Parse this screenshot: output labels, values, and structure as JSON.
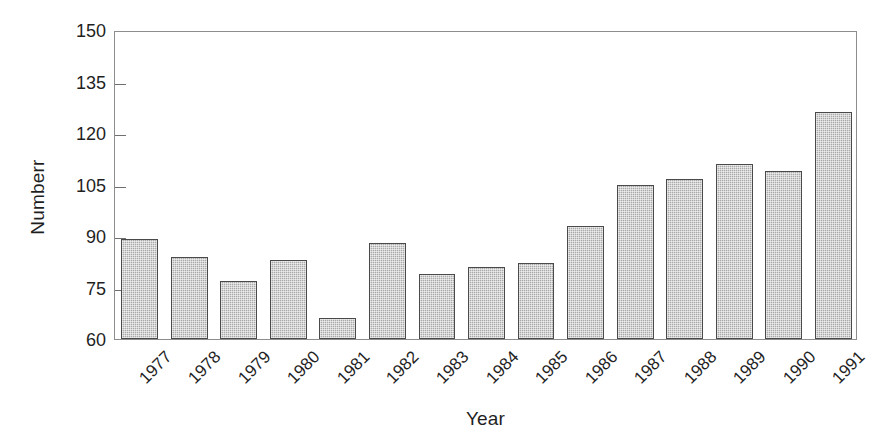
{
  "chart_data": {
    "type": "bar",
    "title": "",
    "xlabel": "Year",
    "ylabel": "Numberr",
    "categories": [
      "1977",
      "1978",
      "1979",
      "1980",
      "1981",
      "1982",
      "1983",
      "1984",
      "1985",
      "1986",
      "1987",
      "1988",
      "1989",
      "1990",
      "1991"
    ],
    "values": [
      89,
      84,
      77,
      83,
      66,
      88,
      79,
      81,
      82,
      93,
      105,
      106.5,
      111,
      109,
      126
    ],
    "ylim": [
      60,
      150
    ],
    "yticks": [
      60,
      75,
      90,
      105,
      120,
      135,
      150
    ],
    "ytick_labels": [
      "60",
      "75",
      "90",
      "105",
      "120",
      "135",
      "150"
    ],
    "xtick_rotation": -45,
    "grid": false,
    "legend": null,
    "series": [
      {
        "name": "Number",
        "values": [
          89,
          84,
          77,
          83,
          66,
          88,
          79,
          81,
          82,
          93,
          105,
          106.5,
          111,
          109,
          126
        ]
      }
    ],
    "colors": {
      "bar_fill": "#a9a9a9",
      "bar_border": "#4a4a4a",
      "axis": "#8d8d8d",
      "text": "#1f1f1f",
      "background": "#ffffff"
    }
  }
}
